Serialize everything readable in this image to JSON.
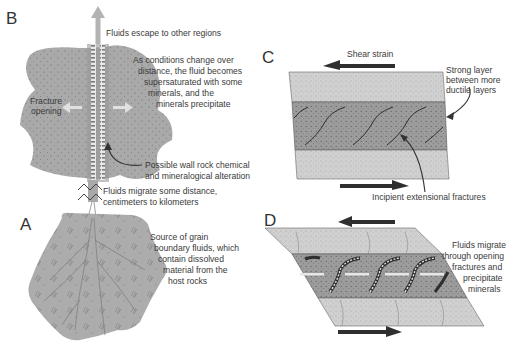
{
  "figure": {
    "panels": {
      "B": {
        "letter": "B",
        "labels": {
          "escape": "Fluids escape to other regions",
          "supersat": [
            "As conditions change over",
            "distance, the fluid becomes",
            "supersaturated with some",
            "minerals, and the",
            "minerals precipitate"
          ],
          "fracture": [
            "Fracture",
            "opening"
          ],
          "alteration": [
            "Possible wall rock chemical",
            "and mineralogical alteration"
          ]
        }
      },
      "migration": {
        "labels": [
          "Fluids migrate some distance,",
          "centimeters to kilometers"
        ]
      },
      "A": {
        "letter": "A",
        "labels": [
          "Source of grain",
          "boundary fluids, which",
          "contain dissolved",
          "material from the",
          "host rocks"
        ]
      },
      "C": {
        "letter": "C",
        "labels": {
          "shear": "Shear strain",
          "strong": [
            "Strong layer",
            "between more",
            "ductile layers"
          ],
          "incipient": "Incipient extensional fractures"
        }
      },
      "D": {
        "letter": "D",
        "labels": [
          "Fluids migrate",
          "through opening",
          "fractures and",
          "precipitate",
          "minerals"
        ]
      }
    },
    "colors": {
      "rock_fill": "#a9a9a9",
      "rock_dark": "#8c8c8c",
      "light_layer": "#cdcdcd",
      "strong_layer": "#9e9e9e",
      "arrow_dark": "#2f2f2f",
      "arrow_light": "#b5b5b5",
      "text": "#3a3a3a"
    }
  }
}
